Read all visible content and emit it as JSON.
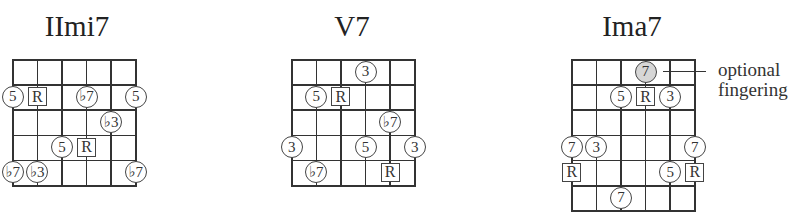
{
  "diagrams": [
    {
      "title": "IImi7",
      "strings": 6,
      "frets": 5,
      "markers": [
        {
          "row": 1,
          "string": 0,
          "label": "5",
          "shape": "circle"
        },
        {
          "row": 1,
          "string": 1,
          "label": "R",
          "shape": "box"
        },
        {
          "row": 1,
          "string": 3,
          "label": "♭7",
          "shape": "circle"
        },
        {
          "row": 1,
          "string": 5,
          "label": "5",
          "shape": "circle"
        },
        {
          "row": 2,
          "string": 4,
          "label": "♭3",
          "shape": "circle"
        },
        {
          "row": 3,
          "string": 2,
          "label": "5",
          "shape": "circle"
        },
        {
          "row": 3,
          "string": 3,
          "label": "R",
          "shape": "box"
        },
        {
          "row": 4,
          "string": 0,
          "label": "♭7",
          "shape": "circle"
        },
        {
          "row": 4,
          "string": 1,
          "label": "♭3",
          "shape": "circle"
        },
        {
          "row": 4,
          "string": 5,
          "label": "♭7",
          "shape": "circle"
        }
      ]
    },
    {
      "title": "V7",
      "strings": 6,
      "frets": 5,
      "markers": [
        {
          "row": 0,
          "string": 3,
          "label": "3",
          "shape": "circle"
        },
        {
          "row": 1,
          "string": 1,
          "label": "5",
          "shape": "circle"
        },
        {
          "row": 1,
          "string": 2,
          "label": "R",
          "shape": "box"
        },
        {
          "row": 2,
          "string": 4,
          "label": "♭7",
          "shape": "circle"
        },
        {
          "row": 3,
          "string": 0,
          "label": "3",
          "shape": "circle"
        },
        {
          "row": 3,
          "string": 3,
          "label": "5",
          "shape": "circle"
        },
        {
          "row": 3,
          "string": 5,
          "label": "3",
          "shape": "circle"
        },
        {
          "row": 4,
          "string": 1,
          "label": "♭7",
          "shape": "circle"
        },
        {
          "row": 4,
          "string": 4,
          "label": "R",
          "shape": "box"
        }
      ]
    },
    {
      "title": "Ima7",
      "strings": 6,
      "frets": 6,
      "markers": [
        {
          "row": 0,
          "string": 3,
          "label": "7",
          "shape": "circle",
          "optional": true
        },
        {
          "row": 1,
          "string": 2,
          "label": "5",
          "shape": "circle"
        },
        {
          "row": 1,
          "string": 3,
          "label": "R",
          "shape": "box"
        },
        {
          "row": 1,
          "string": 4,
          "label": "3",
          "shape": "circle"
        },
        {
          "row": 3,
          "string": 0,
          "label": "7",
          "shape": "circle"
        },
        {
          "row": 3,
          "string": 1,
          "label": "3",
          "shape": "circle"
        },
        {
          "row": 3,
          "string": 5,
          "label": "7",
          "shape": "circle"
        },
        {
          "row": 4,
          "string": 0,
          "label": "R",
          "shape": "box"
        },
        {
          "row": 4,
          "string": 4,
          "label": "5",
          "shape": "circle"
        },
        {
          "row": 4,
          "string": 5,
          "label": "R",
          "shape": "box"
        },
        {
          "row": 5,
          "string": 2,
          "label": "7",
          "shape": "circle"
        }
      ]
    }
  ],
  "annotation": {
    "line1": "optional",
    "line2": "fingering"
  },
  "colors": {
    "line": "#333333",
    "optional_fill": "#d6d6d6"
  }
}
